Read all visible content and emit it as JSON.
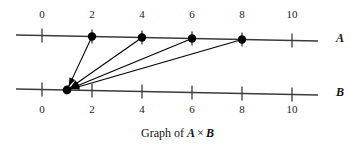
{
  "figure": {
    "caption_prefix": "Graph of",
    "caption_set_a": "A",
    "caption_operator": "×",
    "caption_set_b": "B",
    "caption_full": "Graph of A × B",
    "line_color": "#3a3a3a",
    "dot_color": "#000000",
    "text_color": "#111111"
  },
  "axes": [
    {
      "id": "A",
      "label": "A",
      "label_x": 336,
      "label_y": 31,
      "x0": 16,
      "y0": 35,
      "x1": 318,
      "y1": 41,
      "origin_x": 42,
      "unit_px": 25,
      "ticks": [
        {
          "value": 0,
          "label": "0"
        },
        {
          "value": 2,
          "label": "2"
        },
        {
          "value": 4,
          "label": "4"
        },
        {
          "value": 6,
          "label": "6"
        },
        {
          "value": 8,
          "label": "8"
        },
        {
          "value": 10,
          "label": "10"
        }
      ],
      "label_side": "above",
      "label_y_px": 8,
      "points": [
        2,
        4,
        6,
        8
      ]
    },
    {
      "id": "B",
      "label": "B",
      "label_x": 336,
      "label_y": 85,
      "x0": 16,
      "y0": 89,
      "x1": 318,
      "y1": 95,
      "origin_x": 42,
      "unit_px": 25,
      "ticks": [
        {
          "value": 0,
          "label": "0"
        },
        {
          "value": 2,
          "label": "2"
        },
        {
          "value": 4,
          "label": "4"
        },
        {
          "value": 6,
          "label": "6"
        },
        {
          "value": 8,
          "label": "8"
        },
        {
          "value": 10,
          "label": "10"
        }
      ],
      "label_side": "below",
      "label_y_px": 103,
      "points": [
        1
      ]
    }
  ],
  "arrows": [
    {
      "from_axis": "A",
      "from_value": 2,
      "to_axis": "B",
      "to_value": 1
    },
    {
      "from_axis": "A",
      "from_value": 4,
      "to_axis": "B",
      "to_value": 1
    },
    {
      "from_axis": "A",
      "from_value": 6,
      "to_axis": "B",
      "to_value": 1
    },
    {
      "from_axis": "A",
      "from_value": 8,
      "to_axis": "B",
      "to_value": 1
    }
  ],
  "relation_pairs": [
    [
      2,
      1
    ],
    [
      4,
      1
    ],
    [
      6,
      1
    ],
    [
      8,
      1
    ]
  ]
}
